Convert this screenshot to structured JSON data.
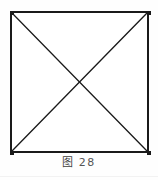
{
  "figure": {
    "caption_index_label": "图",
    "caption_number": "28",
    "caption_full": "图 28",
    "background_color": "#fefefe",
    "line_color": "#1a1a1a",
    "caption_color": "#4a4a4a"
  },
  "geometry": {
    "square": {
      "left": 11,
      "top": 12,
      "right": 148,
      "bottom": 152,
      "width": 137,
      "height": 140,
      "stroke_width": 1.6
    },
    "diagonals": [
      {
        "name": "diagonal-top-left-to-bottom-right",
        "x1": 11,
        "y1": 12,
        "x2": 148,
        "y2": 152
      },
      {
        "name": "diagonal-top-right-to-bottom-left",
        "x1": 148,
        "y1": 12,
        "x2": 11,
        "y2": 152
      }
    ],
    "intersection": {
      "x": 79.5,
      "y": 82
    },
    "stroke_width_diagonal": 1.3
  },
  "vertices": [
    {
      "name": "corner-top-left",
      "x": 11,
      "y": 12
    },
    {
      "name": "corner-top-right",
      "x": 148,
      "y": 12
    },
    {
      "name": "corner-bottom-right",
      "x": 148,
      "y": 152
    },
    {
      "name": "corner-bottom-left",
      "x": 11,
      "y": 152
    }
  ],
  "bottom_rule": {
    "y": 176,
    "color": "#f2f2f2"
  }
}
